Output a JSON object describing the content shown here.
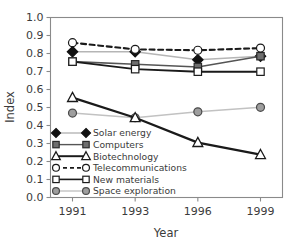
{
  "chart_data": {
    "type": "line",
    "title": "",
    "xlabel": "Year",
    "ylabel": "Index",
    "categories": [
      "1991",
      "1993",
      "1996",
      "1999"
    ],
    "x_tick_labels": [
      "1991",
      "1993",
      "1996",
      "1999"
    ],
    "y_tick_labels": [
      "0.0",
      "0.1",
      "0.2",
      "0.3",
      "0.4",
      "0.5",
      "0.6",
      "0.7",
      "0.8",
      "0.9",
      "1.0"
    ],
    "ylim": [
      0.0,
      1.0
    ],
    "y_tick_step": 0.1,
    "grid": false,
    "legend_position": "lower-left-inside",
    "series": [
      {
        "name": "Solar energy",
        "values": [
          0.81,
          0.81,
          0.765,
          0.785
        ],
        "marker": "diamond",
        "marker_fill": "#111111",
        "marker_edge": "#111111",
        "line_color": "#b5b5b5",
        "line_style": "solid",
        "line_width": 1.6
      },
      {
        "name": "Computers",
        "values": [
          0.755,
          0.74,
          0.725,
          0.785
        ],
        "marker": "square",
        "marker_fill": "#6e6e6e",
        "marker_edge": "#2a2a2a",
        "line_color": "#555555",
        "line_style": "solid",
        "line_width": 1.6
      },
      {
        "name": "Biotechnology",
        "values": [
          0.555,
          0.443,
          0.305,
          0.238
        ],
        "marker": "triangle",
        "marker_fill": "#ffffff",
        "marker_edge": "#1a1a1a",
        "line_color": "#1a1a1a",
        "line_style": "solid",
        "line_width": 2.3
      },
      {
        "name": "Telecommunications",
        "values": [
          0.86,
          0.823,
          0.818,
          0.83
        ],
        "marker": "circle",
        "marker_fill": "#ffffff",
        "marker_edge": "#1a1a1a",
        "line_color": "#1a1a1a",
        "line_style": "dashed",
        "line_width": 2.1
      },
      {
        "name": "New materials",
        "values": [
          0.755,
          0.713,
          0.699,
          0.699
        ],
        "marker": "square",
        "marker_fill": "#ffffff",
        "marker_edge": "#1a1a1a",
        "line_color": "#1a1a1a",
        "line_style": "solid",
        "line_width": 1.9
      },
      {
        "name": "Space exploration",
        "values": [
          0.469,
          0.443,
          0.476,
          0.501
        ],
        "marker": "circle",
        "marker_fill": "#9e9e9e",
        "marker_edge": "#4a4a4a",
        "line_color": "#c2c2c2",
        "line_style": "solid",
        "line_width": 1.5
      }
    ]
  },
  "legend": {
    "entries": [
      "Solar energy",
      "Computers",
      "Biotechnology",
      "Telecommunications",
      "New materials",
      "Space exploration"
    ]
  },
  "colors": {
    "background": "#ffffff",
    "frame": "#8a8a8a",
    "text": "#3b3b3b",
    "dark_line": "#1a1a1a",
    "light_line": "#c2c2c2"
  }
}
